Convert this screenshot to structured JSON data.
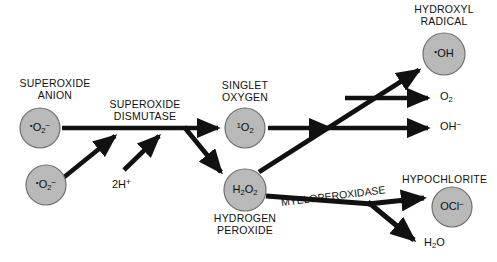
{
  "diagram": {
    "background_color": "#ffffff",
    "node_fill_color": "#b9b9b9",
    "node_stroke_color": "#6e6e6e",
    "arrow_color": "#111111",
    "text_color": "#111111"
  },
  "nodes": [
    {
      "id": "superoxide-anion-upper",
      "caption": "SUPEROXIDE\nANION",
      "formula_html": "<sup>•</sup>O<sub>2</sub><sup>−</sup>",
      "formula_plain": "•O2⁻",
      "cx": 40,
      "cy": 128,
      "r": 20
    },
    {
      "id": "superoxide-anion-lower",
      "caption": "",
      "formula_html": "<sup>•</sup>O<sub>2</sub><sup>−</sup>",
      "formula_plain": "•O2⁻",
      "cx": 46,
      "cy": 185,
      "r": 20
    },
    {
      "id": "singlet-oxygen",
      "caption": "SINGLET\nOXYGEN",
      "formula_html": "<sup>1</sup>O<sub>2</sub>",
      "formula_plain": "1O2",
      "cx": 245,
      "cy": 128,
      "r": 20
    },
    {
      "id": "hydrogen-peroxide",
      "caption": "HYDROGEN\nPEROXIDE",
      "formula_html": "H<sub>2</sub>O<sub>2</sub>",
      "formula_plain": "H2O2",
      "cx": 245,
      "cy": 190,
      "r": 21
    },
    {
      "id": "hydroxyl-radical",
      "caption": "HYDROXYL\nRADICAL",
      "formula_html": "<sup>•</sup>OH",
      "formula_plain": "•OH",
      "cx": 444,
      "cy": 54,
      "r": 21
    },
    {
      "id": "hypochlorite",
      "caption": "HYPOCHLORITE",
      "formula_html": "OCl<sup>−</sup>",
      "formula_plain": "OCl⁻",
      "cx": 452,
      "cy": 207,
      "r": 20
    }
  ],
  "enzymes": [
    {
      "id": "superoxide-dismutase",
      "label": "SUPEROXIDE\nDISMUTASE",
      "x": 145,
      "y": 104
    },
    {
      "id": "myeloperoxidase",
      "label": "MYELOPEROXIDASE",
      "x": 281,
      "y": 196,
      "rotation_deg": -7
    }
  ],
  "reactants": [
    {
      "id": "protons",
      "label_html": "2H<sup>+</sup>",
      "label_plain": "2H+",
      "x": 112,
      "y": 178
    }
  ],
  "products": [
    {
      "id": "oxygen",
      "label_html": "O<sub>2</sub>",
      "label_plain": "O2",
      "x": 440,
      "y": 97
    },
    {
      "id": "hydroxide",
      "label_html": "OH<sup>−</sup>",
      "label_plain": "OH⁻",
      "x": 440,
      "y": 127
    },
    {
      "id": "water",
      "label_html": "H<sub>2</sub>O",
      "label_plain": "H2O",
      "x": 424,
      "y": 243
    }
  ],
  "edges": [
    {
      "id": "edge-superoxide-upper-to-sod",
      "from": "superoxide-anion-upper",
      "to": "superoxide-dismutase",
      "type": "arrow"
    },
    {
      "id": "edge-superoxide-lower-to-sod",
      "from": "superoxide-anion-lower",
      "to": "superoxide-dismutase",
      "type": "arrow"
    },
    {
      "id": "edge-protons-to-sod",
      "from": "protons",
      "to": "superoxide-dismutase",
      "type": "arrow"
    },
    {
      "id": "edge-sod-to-singlet-oxygen",
      "from": "superoxide-dismutase",
      "to": "singlet-oxygen",
      "type": "arrow"
    },
    {
      "id": "edge-sod-to-hydrogen-peroxide",
      "from": "superoxide-dismutase",
      "to": "hydrogen-peroxide",
      "type": "arrow"
    },
    {
      "id": "edge-singlet-oxygen-to-node",
      "from": "singlet-oxygen",
      "to": "reaction-node",
      "type": "arrow"
    },
    {
      "id": "edge-hydrogen-peroxide-to-hydroxyl-radical",
      "from": "hydrogen-peroxide",
      "to": "hydroxyl-radical",
      "type": "arrow"
    },
    {
      "id": "edge-node-to-oxygen",
      "from": "reaction-node",
      "to": "oxygen",
      "type": "arrow"
    },
    {
      "id": "edge-node-to-hydroxide",
      "from": "reaction-node",
      "to": "hydroxide",
      "type": "arrow"
    },
    {
      "id": "edge-hydrogen-peroxide-to-hypochlorite",
      "from": "hydrogen-peroxide",
      "to": "hypochlorite",
      "type": "arrow"
    },
    {
      "id": "edge-hydrogen-peroxide-to-water",
      "from": "hydrogen-peroxide",
      "to": "water",
      "type": "arrow"
    }
  ]
}
